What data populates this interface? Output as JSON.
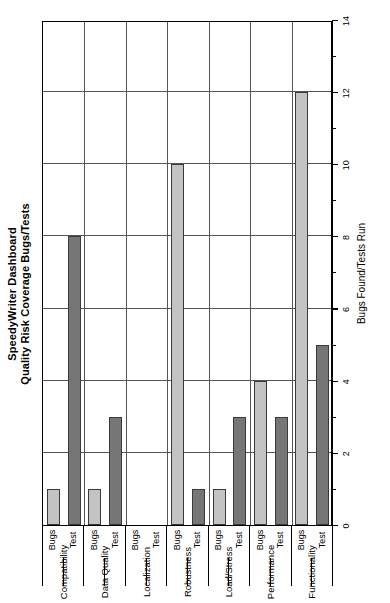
{
  "title": {
    "line1": "SpeedyWriter Dashboard",
    "line2": "Quality Risk Coverage Bugs/Tests"
  },
  "axis": {
    "value_title": "Bugs Found/Tests Run",
    "ticks": [
      "0",
      "2",
      "4",
      "6",
      "8",
      "10",
      "12",
      "14"
    ]
  },
  "series_labels": {
    "test": "Test",
    "bugs": "Bugs"
  },
  "colors": {
    "test_bar": "#767676",
    "bugs_bar": "#c3c3c3",
    "frame": "#000000",
    "gridline": "#555555",
    "background": "#ffffff"
  },
  "chart_data": {
    "type": "bar",
    "orientation": "horizontal",
    "title": "SpeedyWriter Dashboard Quality Risk Coverage Bugs/Tests",
    "xlabel": "Bugs Found/Tests Run",
    "ylabel": "",
    "xlim": [
      0,
      14
    ],
    "xticks": [
      0,
      2,
      4,
      6,
      8,
      10,
      12,
      14
    ],
    "grid": true,
    "legend": "none",
    "categories": [
      "Functionality",
      "Performance",
      "Load/Stress",
      "Robustness",
      "Localization",
      "Data Quality",
      "Compatibility"
    ],
    "series": [
      {
        "name": "Test",
        "values": [
          5,
          3,
          3,
          1,
          0,
          3,
          8
        ]
      },
      {
        "name": "Bugs",
        "values": [
          12,
          4,
          1,
          10,
          0,
          1,
          1
        ]
      }
    ]
  }
}
